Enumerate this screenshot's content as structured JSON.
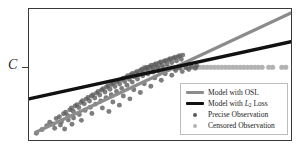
{
  "figure": {
    "y_axis_tick_label": "C",
    "tick_name": "censoring-threshold-tick"
  },
  "legend": {
    "items": [
      {
        "label": "Model with OSL",
        "key": "line",
        "color": "#8c8c8c",
        "name": "legend-item-model-ols"
      },
      {
        "label_prefix": "Model with ",
        "label_math": "L",
        "label_sub": "2",
        "label_suffix": " Loss",
        "key": "line",
        "color": "#111111",
        "name": "legend-item-model-l2"
      },
      {
        "label": "Precise Observation",
        "key": "dot",
        "color": "#5a5a5a",
        "name": "legend-item-precise-observation"
      },
      {
        "label": "Censored Observation",
        "key": "dot",
        "color": "#b3b3b3",
        "name": "legend-item-censored-observation"
      }
    ]
  },
  "chart_data": {
    "type": "scatter",
    "title": "",
    "xlabel": "",
    "ylabel": "C",
    "xlim": [
      0,
      100
    ],
    "ylim": [
      0,
      100
    ],
    "grid": false,
    "legend_position": "lower-right",
    "annotations": [
      {
        "text": "C",
        "type": "y-axis-tick",
        "y": 55.5
      }
    ],
    "colors": {
      "ols_line": "#8c8c8c",
      "l2_line": "#111111",
      "precise_point": "#5a5a5a",
      "censored_point": "#b3b3b3",
      "frame": "#3a3a3a",
      "background": "#ffffff"
    },
    "censoring_threshold_y": 55.5,
    "series": [
      {
        "name": "Model with OSL",
        "type": "line",
        "color": "#8c8c8c",
        "x": [
          2.6,
          100
        ],
        "y": [
          6.0,
          97.0
        ]
      },
      {
        "name": "Model with L2 Loss",
        "type": "line",
        "color": "#111111",
        "x": [
          0.4,
          100
        ],
        "y": [
          31.5,
          75.0
        ]
      },
      {
        "name": "Precise Observation",
        "type": "scatter",
        "color": "#5a5a5a",
        "points": [
          [
            2.8,
            5.2
          ],
          [
            5.0,
            8.0
          ],
          [
            6.8,
            11.0
          ],
          [
            7.9,
            13.6
          ],
          [
            9.2,
            12.2
          ],
          [
            10.4,
            16.4
          ],
          [
            11.6,
            17.8
          ],
          [
            12.4,
            14.0
          ],
          [
            13.2,
            20.0
          ],
          [
            14.0,
            21.2
          ],
          [
            14.8,
            18.6
          ],
          [
            15.6,
            23.0
          ],
          [
            16.2,
            24.4
          ],
          [
            16.9,
            22.0
          ],
          [
            17.6,
            26.0
          ],
          [
            18.3,
            27.0
          ],
          [
            19.0,
            24.8
          ],
          [
            19.8,
            28.6
          ],
          [
            20.4,
            30.0
          ],
          [
            21.1,
            27.6
          ],
          [
            21.8,
            31.2
          ],
          [
            22.5,
            32.4
          ],
          [
            23.1,
            29.8
          ],
          [
            23.8,
            33.6
          ],
          [
            24.4,
            34.6
          ],
          [
            25.1,
            32.0
          ],
          [
            25.8,
            35.8
          ],
          [
            26.4,
            37.0
          ],
          [
            27.0,
            34.4
          ],
          [
            27.7,
            38.2
          ],
          [
            28.3,
            39.2
          ],
          [
            29.0,
            36.6
          ],
          [
            29.6,
            40.4
          ],
          [
            30.2,
            41.4
          ],
          [
            30.9,
            38.8
          ],
          [
            31.5,
            42.4
          ],
          [
            32.1,
            43.4
          ],
          [
            32.8,
            40.8
          ],
          [
            33.4,
            44.4
          ],
          [
            34.0,
            45.4
          ],
          [
            34.6,
            42.8
          ],
          [
            35.2,
            46.2
          ],
          [
            35.9,
            47.2
          ],
          [
            36.5,
            44.6
          ],
          [
            37.1,
            48.0
          ],
          [
            37.7,
            49.0
          ],
          [
            38.3,
            46.4
          ],
          [
            38.9,
            49.8
          ],
          [
            39.5,
            50.8
          ],
          [
            40.1,
            48.2
          ],
          [
            40.7,
            51.4
          ],
          [
            41.3,
            52.4
          ],
          [
            41.9,
            49.8
          ],
          [
            42.5,
            53.0
          ],
          [
            43.1,
            54.0
          ],
          [
            43.7,
            51.4
          ],
          [
            44.3,
            54.6
          ],
          [
            44.9,
            55.4
          ],
          [
            45.5,
            52.8
          ],
          [
            46.1,
            56.0
          ],
          [
            46.7,
            57.0
          ],
          [
            47.3,
            54.2
          ],
          [
            47.9,
            57.4
          ],
          [
            48.5,
            58.2
          ],
          [
            49.1,
            55.6
          ],
          [
            49.7,
            58.8
          ],
          [
            50.3,
            59.6
          ],
          [
            50.9,
            56.8
          ],
          [
            51.5,
            60.0
          ],
          [
            52.1,
            60.8
          ],
          [
            52.7,
            58.0
          ],
          [
            53.3,
            61.2
          ],
          [
            53.9,
            62.0
          ],
          [
            54.5,
            59.2
          ],
          [
            55.1,
            62.4
          ],
          [
            55.7,
            63.2
          ],
          [
            56.3,
            60.4
          ],
          [
            56.9,
            63.6
          ],
          [
            57.5,
            64.4
          ],
          [
            58.1,
            61.6
          ],
          [
            58.7,
            64.8
          ],
          [
            9.8,
            9.0
          ],
          [
            12.0,
            11.4
          ],
          [
            15.0,
            15.2
          ],
          [
            17.0,
            16.8
          ],
          [
            19.2,
            19.4
          ],
          [
            21.4,
            22.6
          ],
          [
            23.4,
            25.0
          ],
          [
            25.4,
            27.4
          ],
          [
            27.4,
            29.8
          ],
          [
            29.4,
            32.2
          ],
          [
            31.4,
            34.6
          ],
          [
            33.4,
            37.0
          ],
          [
            35.4,
            39.4
          ],
          [
            37.4,
            41.8
          ],
          [
            39.4,
            44.2
          ],
          [
            41.4,
            46.6
          ],
          [
            43.4,
            49.0
          ],
          [
            45.4,
            50.4
          ],
          [
            47.4,
            51.8
          ],
          [
            49.4,
            52.6
          ],
          [
            51.4,
            53.4
          ],
          [
            53.4,
            54.0
          ],
          [
            55.4,
            54.6
          ],
          [
            57.4,
            55.0
          ],
          [
            13.6,
            8.4
          ],
          [
            16.4,
            12.0
          ],
          [
            20.0,
            15.0
          ],
          [
            24.0,
            20.2
          ],
          [
            28.0,
            24.4
          ],
          [
            32.0,
            29.0
          ],
          [
            36.0,
            33.6
          ],
          [
            40.0,
            38.4
          ],
          [
            44.0,
            43.0
          ],
          [
            48.0,
            47.4
          ],
          [
            52.0,
            50.6
          ],
          [
            56.0,
            53.0
          ],
          [
            60.0,
            55.2
          ],
          [
            62.0,
            56.0
          ],
          [
            64.0,
            56.6
          ],
          [
            30.5,
            21.8
          ],
          [
            34.5,
            26.6
          ],
          [
            38.5,
            31.4
          ],
          [
            42.5,
            36.2
          ],
          [
            46.5,
            41.0
          ],
          [
            50.5,
            45.6
          ],
          [
            54.5,
            49.4
          ],
          [
            58.5,
            52.2
          ],
          [
            61.0,
            53.8
          ],
          [
            63.5,
            54.8
          ]
        ]
      },
      {
        "name": "Censored Observation",
        "type": "scatter",
        "color": "#b3b3b3",
        "note": "observations clipped at threshold C",
        "points": [
          [
            44.0,
            55.5
          ],
          [
            45.5,
            55.5
          ],
          [
            47.0,
            55.5
          ],
          [
            48.4,
            55.5
          ],
          [
            49.8,
            55.5
          ],
          [
            51.2,
            55.5
          ],
          [
            52.6,
            55.5
          ],
          [
            54.0,
            55.5
          ],
          [
            55.4,
            55.5
          ],
          [
            56.8,
            55.5
          ],
          [
            58.2,
            55.5
          ],
          [
            59.6,
            55.5
          ],
          [
            61.0,
            55.5
          ],
          [
            62.4,
            55.5
          ],
          [
            63.8,
            55.5
          ],
          [
            65.2,
            55.5
          ],
          [
            66.6,
            55.5
          ],
          [
            68.0,
            55.5
          ],
          [
            69.4,
            55.5
          ],
          [
            70.8,
            55.5
          ],
          [
            72.2,
            55.5
          ],
          [
            73.6,
            55.5
          ],
          [
            75.0,
            55.5
          ],
          [
            76.4,
            55.5
          ],
          [
            77.8,
            55.5
          ],
          [
            79.2,
            55.5
          ],
          [
            80.6,
            55.5
          ],
          [
            82.0,
            55.5
          ],
          [
            83.4,
            55.5
          ],
          [
            84.8,
            55.5
          ],
          [
            86.2,
            55.5
          ],
          [
            87.6,
            55.5
          ],
          [
            89.0,
            55.5
          ],
          [
            91.5,
            55.5
          ],
          [
            93.0,
            55.5
          ],
          [
            96.5,
            55.5
          ],
          [
            98.0,
            55.5
          ]
        ]
      }
    ]
  }
}
